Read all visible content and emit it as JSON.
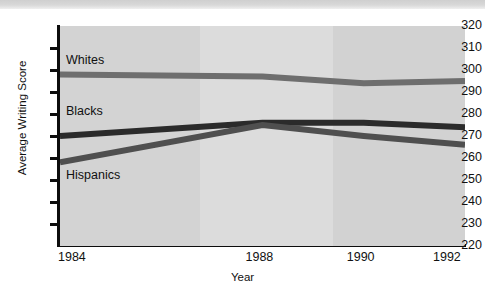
{
  "top_strip": {
    "text": ""
  },
  "chart_data": {
    "type": "line",
    "title": "",
    "xlabel": "Year",
    "ylabel": "Average Writing Score",
    "x": [
      1984,
      1988,
      1990,
      1992
    ],
    "xticklabels": [
      "1984",
      "1988",
      "1990",
      "1992"
    ],
    "yticklabels": [
      "320",
      "310",
      "300",
      "290",
      "280",
      "270",
      "260",
      "250",
      "240",
      "230",
      "220"
    ],
    "yticks": [
      320,
      310,
      300,
      290,
      280,
      270,
      260,
      250,
      240,
      230,
      220
    ],
    "ylim": [
      220,
      320
    ],
    "ystep": 10,
    "grid": false,
    "legend": "inline-labels",
    "series": [
      {
        "name": "Whites",
        "values": [
          298,
          297,
          294,
          295
        ],
        "color": "#6e6e6e"
      },
      {
        "name": "Blacks",
        "values": [
          270,
          276,
          276,
          274
        ],
        "color": "#2b2b2b"
      },
      {
        "name": "Hispanics",
        "values": [
          258,
          275,
          270,
          266
        ],
        "color": "#4f4f4f"
      }
    ],
    "annotations": [
      {
        "text": "Whites",
        "x": 1984,
        "y": 304
      },
      {
        "text": "Blacks",
        "x": 1984,
        "y": 281
      },
      {
        "text": "Hispanics",
        "x": 1984,
        "y": 252
      }
    ],
    "background_bands": [
      {
        "from": 1984,
        "to": 1988,
        "color": "#d3d3d3"
      },
      {
        "from": 1988,
        "to": 1990,
        "color": "#dcdcdc"
      },
      {
        "from": 1990,
        "to": 1992,
        "color": "#d2d2d2"
      }
    ]
  }
}
